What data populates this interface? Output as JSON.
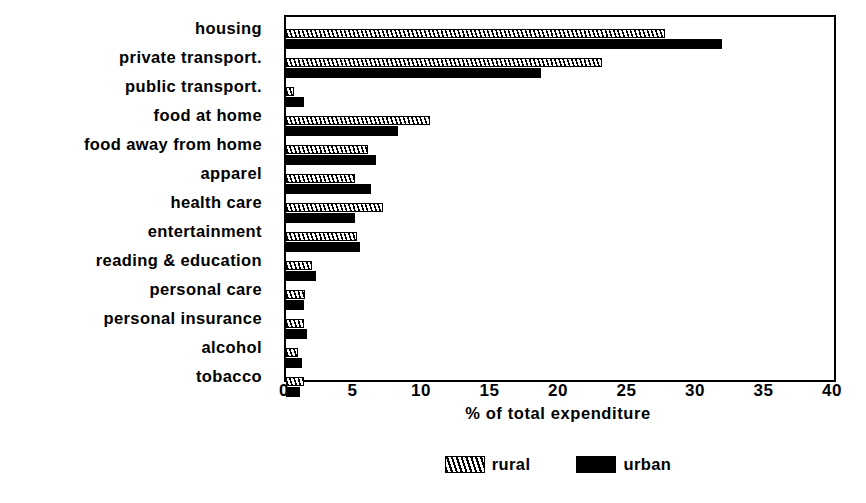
{
  "chart_data": {
    "type": "bar",
    "orientation": "horizontal",
    "title": "",
    "xlabel": "% of total expenditure",
    "ylabel": "",
    "xlim": [
      0,
      40
    ],
    "xticks": [
      0,
      5,
      10,
      15,
      20,
      25,
      30,
      35,
      40
    ],
    "grid": false,
    "legend_position": "bottom-center",
    "categories": [
      "housing",
      "private transport.",
      "public transport.",
      "food at home",
      "food away from home",
      "apparel",
      "health care",
      "entertainment",
      "reading & education",
      "personal care",
      "personal insurance",
      "alcohol",
      "tobacco"
    ],
    "series": [
      {
        "name": "rural",
        "style": "hatched",
        "color": "#000000",
        "values": [
          27.7,
          23.1,
          0.6,
          10.5,
          6.0,
          5.0,
          7.1,
          5.2,
          1.9,
          1.4,
          1.3,
          0.9,
          1.3
        ]
      },
      {
        "name": "urban",
        "style": "solid",
        "color": "#000000",
        "values": [
          31.8,
          18.6,
          1.3,
          8.2,
          6.6,
          6.2,
          5.0,
          5.4,
          2.2,
          1.3,
          1.5,
          1.2,
          1.0
        ]
      }
    ]
  },
  "axis": {
    "tick_labels": [
      "0",
      "5",
      "10",
      "15",
      "20",
      "25",
      "30",
      "35",
      "40"
    ],
    "x_axis_title": "% of total expenditure"
  },
  "legend": {
    "entries": [
      {
        "label": "rural",
        "swatch": "hatched-swatch-icon"
      },
      {
        "label": "urban",
        "swatch": "solid-swatch-icon"
      }
    ]
  }
}
